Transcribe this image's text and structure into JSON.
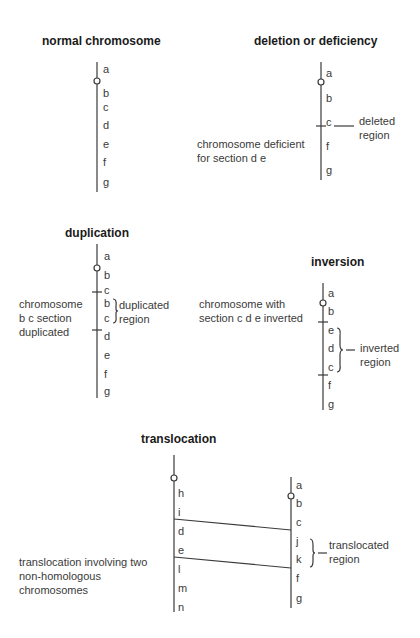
{
  "panels": {
    "normal": {
      "title": "normal chromosome",
      "genes": [
        "a",
        "b",
        "c",
        "d",
        "e",
        "f",
        "g"
      ]
    },
    "deletion": {
      "title": "deletion or deficiency",
      "genes": [
        "a",
        "b",
        "c",
        "f",
        "g"
      ],
      "description_line1": "chromosome deficient",
      "description_line2": "for section d e",
      "region_line1": "deleted",
      "region_line2": "region"
    },
    "duplication": {
      "title": "duplication",
      "genes": [
        "a",
        "b",
        "c",
        "b",
        "c",
        "d",
        "e",
        "f",
        "g"
      ],
      "description_line1": "chromosome",
      "description_line2": "b c section",
      "description_line3": "duplicated",
      "region_line1": "duplicated",
      "region_line2": "region"
    },
    "inversion": {
      "title": "inversion",
      "genes": [
        "a",
        "b",
        "e",
        "d",
        "c",
        "f",
        "g"
      ],
      "description_line1": "chromosome with",
      "description_line2": "section c d e inverted",
      "region_line1": "inverted",
      "region_line2": "region"
    },
    "translocation": {
      "title": "translocation",
      "left_genes": [
        "h",
        "i",
        "d",
        "e",
        "l",
        "m",
        "n"
      ],
      "right_genes": [
        "a",
        "b",
        "c",
        "j",
        "k",
        "f",
        "g"
      ],
      "description_line1": "translocation involving two",
      "description_line2": "non-homologous",
      "description_line3": "chromosomes",
      "region_line1": "translocated",
      "region_line2": "region"
    }
  },
  "colors": {
    "line": "#3a3a3a",
    "text": "#3a3a3a",
    "title": "#1a1a1a",
    "background": "#ffffff"
  }
}
